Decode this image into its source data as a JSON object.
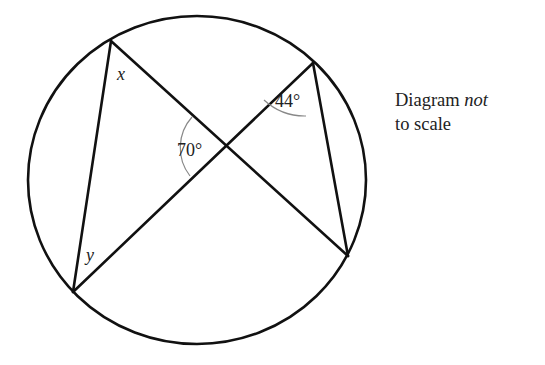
{
  "diagram": {
    "type": "circle-geometry",
    "circle": {
      "cx": 197,
      "cy": 180,
      "rx": 169,
      "ry": 164
    },
    "points": {
      "top_left": [
        111,
        41
      ],
      "top_right": [
        313,
        63
      ],
      "bottom_left": [
        73,
        292
      ],
      "bottom_right": [
        348,
        256
      ],
      "intersection": [
        225,
        147
      ]
    },
    "labels": {
      "x": "x",
      "y": "y",
      "angle_center": "70°",
      "angle_top_right": "44°"
    },
    "colors": {
      "line": "#111111",
      "arc": "#888888",
      "text": "#222222"
    }
  },
  "note": {
    "line1_prefix": "Diagram ",
    "line1_emph": "not",
    "line2": "to scale"
  }
}
